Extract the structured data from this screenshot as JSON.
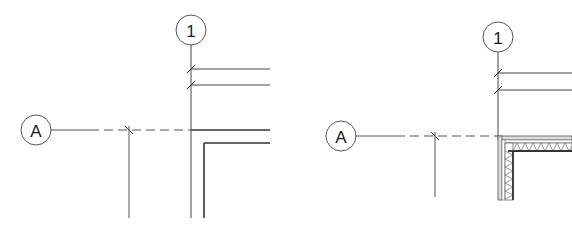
{
  "panels": [
    {
      "id": "left",
      "description": "Grid intersection with simple wall (outline only)",
      "grid_bubbles": [
        {
          "label": "1",
          "cx": 191,
          "cy": 30,
          "r": 15,
          "orientation": "vertical"
        },
        {
          "label": "A",
          "cx": 36,
          "cy": 130,
          "r": 15,
          "orientation": "horizontal"
        }
      ],
      "wall_style": "outline"
    },
    {
      "id": "right",
      "description": "Grid intersection with layered wall (hatched insulation)",
      "grid_bubbles": [
        {
          "label": "1",
          "cx": 498,
          "cy": 37,
          "r": 15,
          "orientation": "vertical"
        },
        {
          "label": "A",
          "cx": 341,
          "cy": 136,
          "r": 15,
          "orientation": "horizontal"
        }
      ],
      "wall_style": "hatched"
    }
  ],
  "colors": {
    "line": "#3a3a3a",
    "thin_line": "#555555",
    "hatch": "#777777",
    "background": "#ffffff"
  }
}
